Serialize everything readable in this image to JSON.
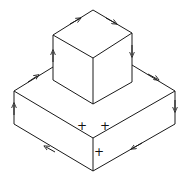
{
  "diagram": {
    "title": "",
    "stroke_color": "#1a1a1a",
    "labels": {
      "plus_left": "+",
      "plus_right": "+",
      "plus_front": "+"
    }
  }
}
